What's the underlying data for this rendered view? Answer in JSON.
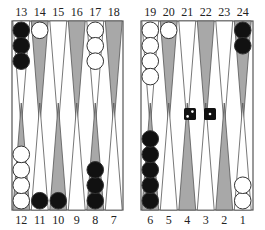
{
  "board": {
    "colors": {
      "background": "#ffffff",
      "frame": "#555555",
      "point_dark": "#a8a8a8",
      "point_light": "#ffffff",
      "point_outline": "#555555",
      "checker_black": "#111111",
      "checker_white": "#ffffff",
      "checker_outline": "#333333",
      "die_face": "#111111",
      "die_pip": "#ffffff"
    },
    "top_labels": [
      "13",
      "14",
      "15",
      "16",
      "17",
      "18",
      "19",
      "20",
      "21",
      "22",
      "23",
      "24"
    ],
    "bottom_labels": [
      "12",
      "11",
      "10",
      "9",
      "8",
      "7",
      "6",
      "5",
      "4",
      "3",
      "2",
      "1"
    ],
    "points": {
      "1": {
        "color": "white",
        "count": 2
      },
      "2": {
        "color": null,
        "count": 0
      },
      "3": {
        "color": null,
        "count": 0
      },
      "4": {
        "color": null,
        "count": 0
      },
      "5": {
        "color": null,
        "count": 0
      },
      "6": {
        "color": "black",
        "count": 5
      },
      "7": {
        "color": null,
        "count": 0
      },
      "8": {
        "color": "black",
        "count": 3
      },
      "9": {
        "color": null,
        "count": 0
      },
      "10": {
        "color": "black",
        "count": 1
      },
      "11": {
        "color": "black",
        "count": 1
      },
      "12": {
        "color": "white",
        "count": 4
      },
      "13": {
        "color": "black",
        "count": 3
      },
      "14": {
        "color": "white",
        "count": 1
      },
      "15": {
        "color": null,
        "count": 0
      },
      "16": {
        "color": null,
        "count": 0
      },
      "17": {
        "color": "white",
        "count": 3
      },
      "18": {
        "color": null,
        "count": 0
      },
      "19": {
        "color": "white",
        "count": 4
      },
      "20": {
        "color": "white",
        "count": 1
      },
      "21": {
        "color": null,
        "count": 0
      },
      "22": {
        "color": null,
        "count": 0
      },
      "23": {
        "color": null,
        "count": 0
      },
      "24": {
        "color": "black",
        "count": 2
      }
    },
    "dice": [
      {
        "value": 2,
        "label": "2"
      },
      {
        "value": 1,
        "label": "1"
      }
    ]
  }
}
